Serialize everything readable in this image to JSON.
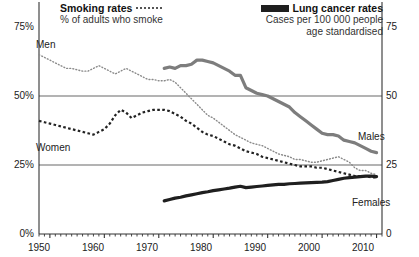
{
  "legend": {
    "smoking": {
      "title": "Smoking rates",
      "swatch": "dotted-line-swatch",
      "subtitle": "% of adults who smoke"
    },
    "cancer": {
      "title": "Lung cancer rates",
      "swatch": "solid-line-swatch",
      "subtitle_line1": "Cases per 100 000 people",
      "subtitle_line2": "age standardised"
    }
  },
  "axes": {
    "left_ticks": [
      "75%",
      "50%",
      "25%",
      "0%"
    ],
    "right_ticks": [
      "75",
      "50",
      "25",
      "0"
    ],
    "x_ticks": [
      "1950",
      "1960",
      "1970",
      "1980",
      "1990",
      "2000",
      "2010"
    ]
  },
  "series_labels": {
    "men_smoking": "Men",
    "women_smoking": "Women",
    "males_cancer": "Males",
    "females_cancer": "Females"
  },
  "colors": {
    "men_smoking": "#8a8a8a",
    "women_smoking": "#222222",
    "males_cancer": "#7d7d7d",
    "females_cancer": "#1f1f1f",
    "gridline": "#9a9a9a",
    "axis": "#333333",
    "background": "#ffffff"
  },
  "chart_data": {
    "type": "line",
    "title": "",
    "xlabel": "",
    "ylabel_left": "% of adults who smoke",
    "ylabel_right": "Cases per 100 000 people age standardised",
    "xlim": [
      1948,
      2011
    ],
    "ylim_left": [
      0,
      75
    ],
    "ylim_right": [
      0,
      75
    ],
    "grid": true,
    "gridlines_y": [
      25,
      50
    ],
    "legend_position": "top",
    "series": [
      {
        "name": "Men",
        "axis": "left",
        "style": "fine-dotted",
        "color": "#8a8a8a",
        "units": "% of adults who smoke",
        "x": [
          1948,
          1949,
          1950,
          1951,
          1952,
          1953,
          1954,
          1955,
          1956,
          1957,
          1958,
          1959,
          1960,
          1961,
          1962,
          1963,
          1964,
          1965,
          1966,
          1967,
          1968,
          1969,
          1970,
          1971,
          1972,
          1973,
          1974,
          1975,
          1976,
          1977,
          1978,
          1979,
          1980,
          1981,
          1982,
          1983,
          1984,
          1985,
          1986,
          1987,
          1988,
          1989,
          1990,
          1991,
          1992,
          1993,
          1994,
          1995,
          1996,
          1997,
          1998,
          1999,
          2000,
          2001,
          2002,
          2003,
          2004,
          2005,
          2006,
          2007,
          2008,
          2009,
          2010
        ],
        "y": [
          65,
          64,
          63,
          62,
          61,
          60,
          60,
          59.5,
          59,
          59,
          60,
          61,
          60,
          59,
          58,
          59,
          60,
          59,
          58,
          57,
          56,
          56,
          55.5,
          55.5,
          56,
          55,
          53,
          51,
          49,
          47,
          45,
          43,
          42,
          40.5,
          39,
          37.5,
          36,
          35,
          34,
          33,
          32.5,
          32,
          31,
          30,
          29,
          28.5,
          28,
          27,
          27,
          26.5,
          26,
          26,
          26.5,
          27,
          27.5,
          28,
          27,
          26,
          24,
          23,
          23,
          22,
          21.5
        ]
      },
      {
        "name": "Women",
        "axis": "left",
        "style": "bold-dashed",
        "color": "#222222",
        "units": "% of adults who smoke",
        "x": [
          1948,
          1949,
          1950,
          1951,
          1952,
          1953,
          1954,
          1955,
          1956,
          1957,
          1958,
          1959,
          1960,
          1961,
          1962,
          1963,
          1964,
          1965,
          1966,
          1967,
          1968,
          1969,
          1970,
          1971,
          1972,
          1973,
          1974,
          1975,
          1976,
          1977,
          1978,
          1979,
          1980,
          1981,
          1982,
          1983,
          1984,
          1985,
          1986,
          1987,
          1988,
          1989,
          1990,
          1991,
          1992,
          1993,
          1994,
          1995,
          1996,
          1997,
          1998,
          1999,
          2000,
          2001,
          2002,
          2003,
          2004,
          2005,
          2006,
          2007,
          2008,
          2009,
          2010
        ],
        "y": [
          41,
          40.5,
          40,
          39.5,
          39,
          38.5,
          38,
          37.5,
          37,
          36.5,
          36,
          37,
          38,
          40,
          43,
          45,
          44,
          42,
          43,
          44,
          44.5,
          45,
          45,
          45,
          44.5,
          43.5,
          42.5,
          41,
          40,
          38.5,
          37,
          36,
          35.5,
          34.5,
          33.5,
          32.5,
          32,
          31,
          30,
          29.5,
          29,
          28,
          27.5,
          27,
          26.5,
          26,
          25.5,
          25,
          24.5,
          24.5,
          24.5,
          24,
          24,
          23.5,
          23,
          22.5,
          22,
          21.5,
          21,
          21,
          21,
          20.5,
          20.5
        ]
      },
      {
        "name": "Males",
        "axis": "right",
        "style": "thick-solid-grey",
        "color": "#7d7d7d",
        "units": "cases per 100 000 people, age standardised",
        "x": [
          1971,
          1972,
          1973,
          1974,
          1975,
          1976,
          1977,
          1978,
          1979,
          1980,
          1981,
          1982,
          1983,
          1984,
          1985,
          1986,
          1987,
          1988,
          1989,
          1990,
          1991,
          1992,
          1993,
          1994,
          1995,
          1996,
          1997,
          1998,
          1999,
          2000,
          2001,
          2002,
          2003,
          2004,
          2005,
          2006,
          2007,
          2008,
          2009,
          2010
        ],
        "y": [
          60,
          60.5,
          60,
          61,
          61,
          61.5,
          63,
          63,
          62.5,
          62,
          61,
          60,
          59,
          57.5,
          57.5,
          53,
          52,
          51,
          50.5,
          50,
          49,
          48,
          47,
          46,
          44,
          42.5,
          41,
          39.5,
          38,
          36.5,
          36,
          36,
          35.5,
          34,
          33.5,
          33,
          32,
          31,
          30,
          29.5
        ]
      },
      {
        "name": "Females",
        "axis": "right",
        "style": "thick-solid-black",
        "color": "#1f1f1f",
        "units": "cases per 100 000 people, age standardised",
        "x": [
          1971,
          1972,
          1973,
          1974,
          1975,
          1976,
          1977,
          1978,
          1979,
          1980,
          1981,
          1982,
          1983,
          1984,
          1985,
          1986,
          1987,
          1988,
          1989,
          1990,
          1991,
          1992,
          1993,
          1994,
          1995,
          1996,
          1997,
          1998,
          1999,
          2000,
          2001,
          2002,
          2003,
          2004,
          2005,
          2006,
          2007,
          2008,
          2009,
          2010
        ],
        "y": [
          12,
          12.5,
          13,
          13.3,
          13.8,
          14.2,
          14.6,
          15,
          15.3,
          15.7,
          16,
          16.3,
          16.6,
          17,
          17.3,
          16.8,
          17,
          17.2,
          17.4,
          17.6,
          17.8,
          18,
          18,
          18.2,
          18.3,
          18.4,
          18.5,
          18.6,
          18.7,
          18.8,
          19,
          19.4,
          19.8,
          20.2,
          20.4,
          20.6,
          20.8,
          21,
          21,
          20.8
        ]
      }
    ]
  }
}
